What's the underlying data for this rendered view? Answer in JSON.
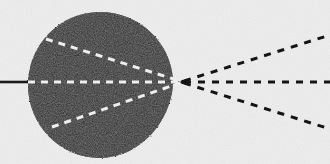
{
  "figure": {
    "canvas": {
      "width": 330,
      "height": 164
    },
    "colors": {
      "background": "#eeeeee",
      "ink": "#1a1a1a",
      "blob_fill": "#151515",
      "dash_light": "#f2f2f2",
      "dash_dark": "#141414"
    },
    "blob": {
      "name": "solid-black-region",
      "shape": "disc-with-right-vertex",
      "center": {
        "x": 100,
        "y": 85
      },
      "radius": 73,
      "vertex": {
        "x": 183,
        "y": 82
      }
    },
    "focal_point": {
      "x": 183,
      "y": 82
    },
    "axis_line": {
      "name": "optical-axis",
      "style": "solid",
      "from": {
        "x": 0,
        "y": 82
      },
      "to": {
        "x": 28,
        "y": 82
      },
      "width": 2.6
    },
    "light_dashes": [
      {
        "name": "upper-converging-ray",
        "color": "#f2f2f2",
        "from": {
          "x": 46,
          "y": 39
        },
        "to": {
          "x": 180,
          "y": 81
        },
        "dash": "7 6",
        "width": 3
      },
      {
        "name": "axis-converging-ray",
        "color": "#f2f2f2",
        "from": {
          "x": 28,
          "y": 82
        },
        "to": {
          "x": 180,
          "y": 82
        },
        "dash": "7 6",
        "width": 3
      },
      {
        "name": "lower-converging-ray",
        "color": "#f2f2f2",
        "from": {
          "x": 52,
          "y": 127
        },
        "to": {
          "x": 180,
          "y": 83
        },
        "dash": "7 6",
        "width": 3
      }
    ],
    "dark_dashes": [
      {
        "name": "upper-diverging-ray",
        "color": "#141414",
        "from": {
          "x": 184,
          "y": 81
        },
        "to": {
          "x": 330,
          "y": 35
        },
        "dash": "7 7",
        "width": 3
      },
      {
        "name": "axis-diverging-ray",
        "color": "#141414",
        "from": {
          "x": 184,
          "y": 82
        },
        "to": {
          "x": 330,
          "y": 82
        },
        "dash": "7 7",
        "width": 3
      },
      {
        "name": "lower-diverging-ray",
        "color": "#141414",
        "from": {
          "x": 184,
          "y": 83
        },
        "to": {
          "x": 330,
          "y": 129
        },
        "dash": "7 7",
        "width": 3
      }
    ]
  }
}
